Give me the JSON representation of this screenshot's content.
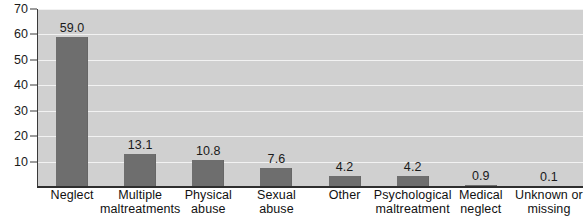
{
  "chart_data": {
    "type": "bar",
    "title": "",
    "subtitle": "",
    "xlabel": "",
    "ylabel": "",
    "ylim": [
      0,
      70
    ],
    "ytick_step": 10,
    "yticks": [
      70,
      60,
      50,
      40,
      30,
      20,
      10
    ],
    "grid": true,
    "legend": false,
    "orientation": "vertical",
    "categories": [
      "Neglect",
      "Multiple maltreatments",
      "Physical abuse",
      "Sexual abuse",
      "Other",
      "Psychological maltreatment",
      "Medical neglect",
      "Unknown or missing"
    ],
    "category_lines": [
      [
        "Neglect"
      ],
      [
        "Multiple",
        "maltreatments"
      ],
      [
        "Physical",
        "abuse"
      ],
      [
        "Sexual",
        "abuse"
      ],
      [
        "Other"
      ],
      [
        "Psychological",
        "maltreatment"
      ],
      [
        "Medical",
        "neglect"
      ],
      [
        "Unknown or",
        "missing"
      ]
    ],
    "values": [
      59.0,
      13.1,
      10.8,
      7.6,
      4.2,
      4.2,
      0.9,
      0.1
    ],
    "value_labels": [
      "59.0",
      "13.1",
      "10.8",
      "7.6",
      "4.2",
      "4.2",
      "0.9",
      "0.1"
    ],
    "colors": {
      "bar": "#6e6e6e",
      "plot_background": "#d2d2d2",
      "gridline": "#f2f2f2",
      "axis": "#2e2e2e",
      "text": "#111111",
      "page_background": "#ffffff"
    }
  }
}
